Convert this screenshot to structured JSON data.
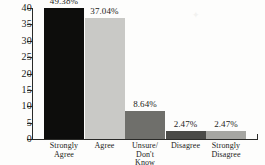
{
  "chart_data": {
    "type": "bar",
    "title": "",
    "xlabel": "",
    "ylabel": "",
    "ylim": [
      0,
      40
    ],
    "yticks": [
      0,
      5,
      10,
      15,
      20,
      25,
      30,
      35,
      40
    ],
    "grid": false,
    "legend": "none",
    "categories": [
      "Strongly Agree",
      "Agree",
      "Unsure/ Don't Know",
      "Disagree",
      "Strongly Disagree"
    ],
    "category_lines": [
      [
        "Strongly",
        "Agree"
      ],
      [
        "Agree"
      ],
      [
        "Unsure/",
        "Don't",
        "Know"
      ],
      [
        "Disagree"
      ],
      [
        "Strongly",
        "Disagree"
      ]
    ],
    "values": [
      49.38,
      37.04,
      8.64,
      2.47,
      2.47
    ],
    "value_labels": [
      "49.38%",
      "37.04%",
      "8.64%",
      "2.47%",
      "2.47%"
    ],
    "bar_colors": [
      "#0d0d0c",
      "#c9c9c6",
      "#6f6f6b",
      "#4a4a47",
      "#a6a6a2"
    ]
  },
  "axis": {
    "y_tick_labels": [
      "0",
      "5",
      "10",
      "15",
      "20",
      "25",
      "30",
      "35",
      "40"
    ]
  },
  "decor": {
    "speck": "✦"
  }
}
